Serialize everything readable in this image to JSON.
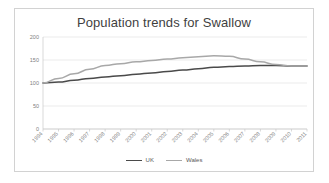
{
  "chart_data": {
    "type": "line",
    "title": "Population trends for Swallow",
    "xlabel": "",
    "ylabel": "",
    "ylim": [
      0,
      200
    ],
    "yticks": [
      0,
      50,
      100,
      150,
      200
    ],
    "grid": true,
    "legend_position": "bottom",
    "categories": [
      "1994",
      "1995",
      "1996",
      "1997",
      "1998",
      "1999",
      "2000",
      "2001",
      "2002",
      "2003",
      "2004",
      "2005",
      "2006",
      "2007",
      "2008",
      "2009",
      "2010",
      "2011"
    ],
    "series": [
      {
        "name": "UK",
        "color": "#4a4a4a",
        "values": [
          100,
          102,
          106,
          110,
          113,
          116,
          119,
          122,
          125,
          128,
          131,
          134,
          136,
          137,
          138,
          138,
          137,
          137
        ]
      },
      {
        "name": "Wales",
        "color": "#a8a8a8",
        "values": [
          100,
          110,
          120,
          130,
          138,
          142,
          146,
          149,
          152,
          155,
          157,
          159,
          158,
          152,
          146,
          140,
          137,
          137
        ]
      }
    ]
  },
  "legend": {
    "items": [
      {
        "label": "UK"
      },
      {
        "label": "Wales"
      }
    ]
  }
}
